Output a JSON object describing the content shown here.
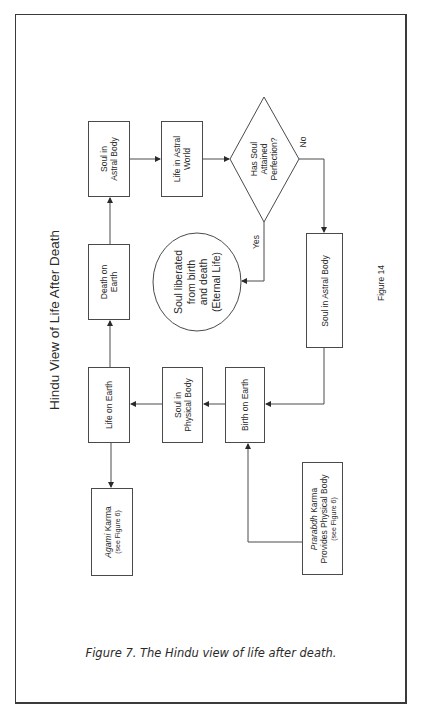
{
  "diagram": {
    "title": "Hindu View of Life After Death",
    "figure_label": "Figure 14",
    "nodes": {
      "soul_astral_top": {
        "line1": "Soul in",
        "line2": "Astral Body"
      },
      "life_astral_world": {
        "line1": "Life in Astral",
        "line2": "World"
      },
      "decision": {
        "line1": "Has Soul",
        "line2": "Attained",
        "line3": "Perfection?"
      },
      "liberated": {
        "line1": "Soul liberated",
        "line2": "from birth",
        "line3": "and death",
        "line4": "(Eternal Life)"
      },
      "soul_astral_right": {
        "line1": "Soul in Astral Body"
      },
      "death_on_earth": {
        "line1": "Death on",
        "line2": "Earth"
      },
      "life_on_earth": {
        "line1": "Life on Earth"
      },
      "soul_physical": {
        "line1": "Soul in",
        "line2": "Physical Body"
      },
      "birth_on_earth": {
        "line1": "Birth on Earth"
      },
      "agami": {
        "line1_italic": "Agami",
        "line1_rest": " Karma",
        "line2": "(see Figure 6)"
      },
      "prarabdh": {
        "line1_italic": "Prarabdh",
        "line1_rest": " Karma",
        "line2": "Provides Physical Body",
        "line3": "(see Figure 6)"
      }
    },
    "edge_labels": {
      "yes": "Yes",
      "no": "No"
    },
    "edges": [
      {
        "from": "life_on_earth",
        "to": "death_on_earth"
      },
      {
        "from": "death_on_earth",
        "to": "soul_astral_top"
      },
      {
        "from": "soul_astral_top",
        "to": "life_astral_world"
      },
      {
        "from": "life_astral_world",
        "to": "decision"
      },
      {
        "from": "decision",
        "to": "liberated",
        "label": "Yes"
      },
      {
        "from": "decision",
        "to": "soul_astral_right",
        "label": "No"
      },
      {
        "from": "soul_astral_right",
        "to": "birth_on_earth"
      },
      {
        "from": "birth_on_earth",
        "to": "soul_physical"
      },
      {
        "from": "soul_physical",
        "to": "life_on_earth"
      },
      {
        "from": "life_on_earth",
        "to": "agami"
      },
      {
        "from": "prarabdh",
        "to": "birth_on_earth"
      }
    ]
  },
  "caption": "Figure 7. The Hindu view of life after death.",
  "colors": {
    "line": "#4a4a4a",
    "text": "#2a2a2a",
    "background": "#ffffff"
  }
}
